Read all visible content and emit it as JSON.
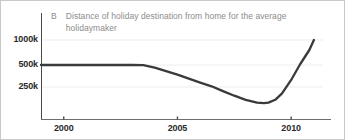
{
  "chart_data": {
    "type": "line",
    "title": "Distance of holiday destination from home for the average holidaymaker",
    "panel_label": "B",
    "xlabel": "",
    "ylabel": "",
    "grid": true,
    "legend": "none",
    "xlim": [
      1999.0,
      2011.4
    ],
    "ylim": [
      0,
      1150000
    ],
    "xticks": [
      2000,
      2005,
      2010
    ],
    "xtick_labels": [
      "2000",
      "2005",
      "2010"
    ],
    "yticks": [
      250000,
      500000,
      1000000
    ],
    "ytick_labels": [
      "250k",
      "500k",
      "1000k"
    ],
    "series": [
      {
        "name": "Distance of holiday destination from home",
        "color": "#3a3a3a",
        "x": [
          1999.0,
          2000.0,
          2001.0,
          2002.0,
          2003.0,
          2003.5,
          2004.0,
          2004.5,
          2005.0,
          2005.5,
          2006.0,
          2006.5,
          2007.0,
          2007.5,
          2008.0,
          2008.5,
          2008.8,
          2009.0,
          2009.3,
          2009.6,
          2010.0,
          2010.4,
          2010.8,
          2011.0
        ],
        "y": [
          500000,
          500000,
          500000,
          500000,
          500000,
          498000,
          470000,
          430000,
          390000,
          345000,
          300000,
          258000,
          218000,
          182000,
          150000,
          128000,
          124000,
          128000,
          150000,
          200000,
          330000,
          520000,
          800000,
          1000000
        ]
      }
    ]
  },
  "axis": {
    "y_axis_name": "y-axis-line",
    "x_axis_name": "x-axis-line"
  }
}
